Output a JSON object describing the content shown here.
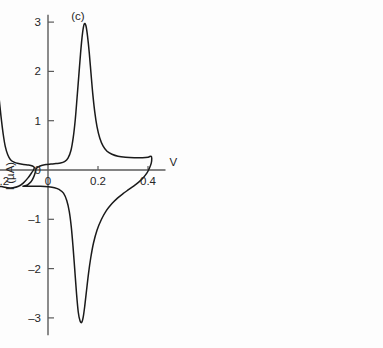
{
  "chart_data": {
    "type": "line",
    "title": "",
    "subtitle": "",
    "xlabel": "V",
    "ylabel": "I (µA)",
    "xlim": [
      -0.72,
      0.47
    ],
    "ylim": [
      -3.35,
      3.15
    ],
    "grid": false,
    "legend_position": "none",
    "x_ticks": [
      {
        "value": -0.6,
        "label": "–0.6"
      },
      {
        "value": -0.4,
        "label": "–0.4"
      },
      {
        "value": -0.2,
        "label": "–0.2"
      },
      {
        "value": 0.0,
        "label": "0"
      },
      {
        "value": 0.2,
        "label": "0.2"
      },
      {
        "value": 0.4,
        "label": "0.4"
      }
    ],
    "y_ticks": [
      {
        "value": 3,
        "label": "3"
      },
      {
        "value": 2,
        "label": "2"
      },
      {
        "value": 1,
        "label": "1"
      },
      {
        "value": 0,
        "label": "0"
      },
      {
        "value": -1,
        "label": "–1"
      },
      {
        "value": -2,
        "label": "–2"
      },
      {
        "value": -3,
        "label": "–3"
      }
    ],
    "annotations": [
      {
        "text": "(a)",
        "x": -0.51,
        "y": 3.05
      },
      {
        "text": "(b)",
        "x": -0.24,
        "y": 3.05
      },
      {
        "text": "(c)",
        "x": 0.12,
        "y": 3.05
      }
    ],
    "series": [
      {
        "name": "(a)",
        "stroke": "#1a1a1a",
        "description": "cyclic voltammogram, anodic peak +2.70 uA at -0.435 V, cathodic peak -3.00 uA at -0.49 V",
        "anodic_peak": {
          "potential": -0.435,
          "current": 2.7
        },
        "cathodic_peak": {
          "potential": -0.49,
          "current": -3.0
        },
        "switch_potentials": [
          -0.695,
          -0.31
        ],
        "points": [
          [
            -0.695,
            -0.36
          ],
          [
            -0.672,
            -0.33
          ],
          [
            -0.655,
            -0.27
          ],
          [
            -0.645,
            -0.18
          ],
          [
            -0.638,
            -0.06
          ],
          [
            -0.634,
            0.02
          ],
          [
            -0.63,
            0.05
          ],
          [
            -0.62,
            0.07
          ],
          [
            -0.605,
            0.1
          ],
          [
            -0.59,
            0.14
          ],
          [
            -0.575,
            0.2
          ],
          [
            -0.56,
            0.29
          ],
          [
            -0.545,
            0.42
          ],
          [
            -0.532,
            0.6
          ],
          [
            -0.52,
            0.85
          ],
          [
            -0.508,
            1.18
          ],
          [
            -0.497,
            1.55
          ],
          [
            -0.486,
            1.93
          ],
          [
            -0.474,
            2.25
          ],
          [
            -0.462,
            2.5
          ],
          [
            -0.45,
            2.65
          ],
          [
            -0.438,
            2.7
          ],
          [
            -0.428,
            2.66
          ],
          [
            -0.418,
            2.52
          ],
          [
            -0.408,
            2.28
          ],
          [
            -0.398,
            1.95
          ],
          [
            -0.388,
            1.55
          ],
          [
            -0.378,
            1.15
          ],
          [
            -0.368,
            0.8
          ],
          [
            -0.358,
            0.53
          ],
          [
            -0.348,
            0.34
          ],
          [
            -0.338,
            0.21
          ],
          [
            -0.328,
            0.13
          ],
          [
            -0.318,
            0.08
          ],
          [
            -0.31,
            0.05
          ],
          [
            -0.312,
            0.01
          ],
          [
            -0.32,
            -0.04
          ],
          [
            -0.334,
            -0.13
          ],
          [
            -0.35,
            -0.24
          ],
          [
            -0.368,
            -0.33
          ],
          [
            -0.388,
            -0.37
          ],
          [
            -0.41,
            -0.37
          ],
          [
            -0.43,
            -0.34
          ],
          [
            -0.446,
            -0.31
          ],
          [
            -0.456,
            -0.33
          ],
          [
            -0.466,
            -0.45
          ],
          [
            -0.474,
            -0.68
          ],
          [
            -0.481,
            -1.0
          ],
          [
            -0.487,
            -1.42
          ],
          [
            -0.493,
            -1.9
          ],
          [
            -0.498,
            -2.35
          ],
          [
            -0.504,
            -2.72
          ],
          [
            -0.511,
            -2.93
          ],
          [
            -0.519,
            -3.0
          ],
          [
            -0.528,
            -2.95
          ],
          [
            -0.537,
            -2.76
          ],
          [
            -0.545,
            -2.4
          ],
          [
            -0.552,
            -1.92
          ],
          [
            -0.558,
            -1.45
          ],
          [
            -0.565,
            -1.05
          ],
          [
            -0.573,
            -0.76
          ],
          [
            -0.583,
            -0.57
          ],
          [
            -0.596,
            -0.45
          ],
          [
            -0.614,
            -0.39
          ],
          [
            -0.64,
            -0.37
          ],
          [
            -0.67,
            -0.36
          ],
          [
            -0.695,
            -0.36
          ]
        ]
      },
      {
        "name": "(b)",
        "stroke": "#1a1a1a",
        "description": "cyclic voltammogram with split anodic wave, main peak +2.60 uA at -0.255 V, shoulder +1.65 uA at -0.200 V, cathodic main peak -2.90 uA at -0.30 V with shoulder near -2.05 uA",
        "anodic_peak": {
          "potential": -0.255,
          "current": 2.6
        },
        "anodic_shoulder": {
          "potential": -0.2,
          "current": 1.65
        },
        "cathodic_peak": {
          "potential": -0.3,
          "current": -2.9
        },
        "cathodic_shoulder": {
          "potential": -0.255,
          "current": -2.05
        },
        "switch_potentials": [
          -0.46,
          -0.055
        ],
        "points": [
          [
            -0.46,
            -0.34
          ],
          [
            -0.44,
            -0.31
          ],
          [
            -0.424,
            -0.25
          ],
          [
            -0.412,
            -0.15
          ],
          [
            -0.404,
            -0.05
          ],
          [
            -0.4,
            0.03
          ],
          [
            -0.392,
            0.08
          ],
          [
            -0.378,
            0.12
          ],
          [
            -0.36,
            0.15
          ],
          [
            -0.34,
            0.18
          ],
          [
            -0.322,
            0.23
          ],
          [
            -0.308,
            0.32
          ],
          [
            -0.298,
            0.48
          ],
          [
            -0.29,
            0.72
          ],
          [
            -0.283,
            1.05
          ],
          [
            -0.277,
            1.45
          ],
          [
            -0.271,
            1.88
          ],
          [
            -0.265,
            2.25
          ],
          [
            -0.26,
            2.48
          ],
          [
            -0.255,
            2.58
          ],
          [
            -0.25,
            2.54
          ],
          [
            -0.245,
            2.38
          ],
          [
            -0.24,
            2.14
          ],
          [
            -0.234,
            1.92
          ],
          [
            -0.227,
            1.75
          ],
          [
            -0.22,
            1.66
          ],
          [
            -0.214,
            1.63
          ],
          [
            -0.209,
            1.66
          ],
          [
            -0.205,
            1.7
          ],
          [
            -0.201,
            1.66
          ],
          [
            -0.197,
            1.52
          ],
          [
            -0.192,
            1.28
          ],
          [
            -0.186,
            1.0
          ],
          [
            -0.179,
            0.72
          ],
          [
            -0.171,
            0.48
          ],
          [
            -0.161,
            0.31
          ],
          [
            -0.15,
            0.21
          ],
          [
            -0.136,
            0.16
          ],
          [
            -0.118,
            0.13
          ],
          [
            -0.098,
            0.11
          ],
          [
            -0.078,
            0.1
          ],
          [
            -0.062,
            0.08
          ],
          [
            -0.055,
            0.05
          ],
          [
            -0.058,
            0.0
          ],
          [
            -0.066,
            -0.06
          ],
          [
            -0.08,
            -0.16
          ],
          [
            -0.098,
            -0.26
          ],
          [
            -0.118,
            -0.33
          ],
          [
            -0.14,
            -0.36
          ],
          [
            -0.162,
            -0.36
          ],
          [
            -0.182,
            -0.34
          ],
          [
            -0.198,
            -0.34
          ],
          [
            -0.21,
            -0.42
          ],
          [
            -0.22,
            -0.62
          ],
          [
            -0.228,
            -0.92
          ],
          [
            -0.235,
            -1.3
          ],
          [
            -0.241,
            -1.65
          ],
          [
            -0.247,
            -1.9
          ],
          [
            -0.253,
            -2.03
          ],
          [
            -0.259,
            -2.08
          ],
          [
            -0.266,
            -2.12
          ],
          [
            -0.273,
            -2.22
          ],
          [
            -0.279,
            -2.42
          ],
          [
            -0.285,
            -2.66
          ],
          [
            -0.291,
            -2.83
          ],
          [
            -0.298,
            -2.9
          ],
          [
            -0.305,
            -2.86
          ],
          [
            -0.312,
            -2.7
          ],
          [
            -0.319,
            -2.4
          ],
          [
            -0.326,
            -2.02
          ],
          [
            -0.333,
            -1.62
          ],
          [
            -0.341,
            -1.25
          ],
          [
            -0.35,
            -0.94
          ],
          [
            -0.361,
            -0.7
          ],
          [
            -0.375,
            -0.53
          ],
          [
            -0.393,
            -0.42
          ],
          [
            -0.416,
            -0.36
          ],
          [
            -0.44,
            -0.34
          ],
          [
            -0.46,
            -0.34
          ]
        ]
      },
      {
        "name": "(c)",
        "stroke": "#1a1a1a",
        "description": "cyclic voltammogram, sharp anodic peak +2.98 uA at 0.145 V, cathodic peak -3.10 uA at 0.135 V",
        "anodic_peak": {
          "potential": 0.145,
          "current": 2.98
        },
        "cathodic_peak": {
          "potential": 0.135,
          "current": -3.1
        },
        "switch_potentials": [
          -0.1,
          0.415
        ],
        "points": [
          [
            -0.1,
            -0.33
          ],
          [
            -0.082,
            -0.3
          ],
          [
            -0.068,
            -0.24
          ],
          [
            -0.058,
            -0.15
          ],
          [
            -0.051,
            -0.05
          ],
          [
            -0.048,
            0.02
          ],
          [
            -0.04,
            0.06
          ],
          [
            -0.026,
            0.09
          ],
          [
            -0.008,
            0.11
          ],
          [
            0.012,
            0.12
          ],
          [
            0.032,
            0.13
          ],
          [
            0.05,
            0.14
          ],
          [
            0.066,
            0.17
          ],
          [
            0.08,
            0.24
          ],
          [
            0.092,
            0.4
          ],
          [
            0.101,
            0.66
          ],
          [
            0.109,
            1.02
          ],
          [
            0.116,
            1.45
          ],
          [
            0.123,
            1.9
          ],
          [
            0.13,
            2.35
          ],
          [
            0.136,
            2.68
          ],
          [
            0.141,
            2.88
          ],
          [
            0.146,
            2.97
          ],
          [
            0.152,
            2.92
          ],
          [
            0.158,
            2.72
          ],
          [
            0.165,
            2.38
          ],
          [
            0.172,
            1.96
          ],
          [
            0.179,
            1.55
          ],
          [
            0.187,
            1.18
          ],
          [
            0.196,
            0.88
          ],
          [
            0.207,
            0.65
          ],
          [
            0.22,
            0.49
          ],
          [
            0.236,
            0.38
          ],
          [
            0.256,
            0.32
          ],
          [
            0.28,
            0.28
          ],
          [
            0.31,
            0.26
          ],
          [
            0.345,
            0.25
          ],
          [
            0.378,
            0.25
          ],
          [
            0.4,
            0.26
          ],
          [
            0.412,
            0.28
          ],
          [
            0.415,
            0.24
          ],
          [
            0.413,
            0.14
          ],
          [
            0.406,
            0.04
          ],
          [
            0.396,
            -0.06
          ],
          [
            0.382,
            -0.15
          ],
          [
            0.364,
            -0.24
          ],
          [
            0.344,
            -0.32
          ],
          [
            0.322,
            -0.4
          ],
          [
            0.3,
            -0.48
          ],
          [
            0.278,
            -0.57
          ],
          [
            0.256,
            -0.68
          ],
          [
            0.234,
            -0.82
          ],
          [
            0.214,
            -1.0
          ],
          [
            0.196,
            -1.22
          ],
          [
            0.182,
            -1.48
          ],
          [
            0.171,
            -1.78
          ],
          [
            0.162,
            -2.1
          ],
          [
            0.154,
            -2.45
          ],
          [
            0.147,
            -2.76
          ],
          [
            0.141,
            -2.98
          ],
          [
            0.135,
            -3.09
          ],
          [
            0.128,
            -3.06
          ],
          [
            0.121,
            -2.88
          ],
          [
            0.114,
            -2.5
          ],
          [
            0.107,
            -2.02
          ],
          [
            0.1,
            -1.55
          ],
          [
            0.093,
            -1.15
          ],
          [
            0.085,
            -0.84
          ],
          [
            0.075,
            -0.62
          ],
          [
            0.062,
            -0.47
          ],
          [
            0.046,
            -0.4
          ],
          [
            0.026,
            -0.36
          ],
          [
            0.002,
            -0.34
          ],
          [
            -0.03,
            -0.33
          ],
          [
            -0.065,
            -0.33
          ],
          [
            -0.1,
            -0.33
          ]
        ]
      }
    ]
  },
  "figure": {
    "x_axis_label": "V",
    "y_axis_label": "I (µA)"
  }
}
